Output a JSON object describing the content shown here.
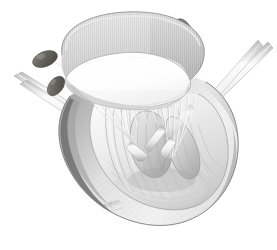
{
  "figure": {
    "medium": "graphite / pencil stipple medical illustration",
    "palette": {
      "background": "#ffffff",
      "paper": "#fdfdfd",
      "outline_dark": "#6f6f6f",
      "outline_mid": "#9a9a9a",
      "outline_light": "#c9c9c9",
      "myocardium_light": "#ededed",
      "myocardium_mid": "#d9d9d9",
      "myocardium_shadow": "#a8a8a8",
      "myocardium_deep_shadow": "#7d7d7d",
      "ring_fabric": "#dcdcdc",
      "ring_fabric_shade": "#bdbdbd",
      "orifice_white": "#fdfdfd",
      "pledget_dark": "#5d5a56",
      "pledget_mid": "#7b7771",
      "pledget_highlight": "#a5a19b",
      "instrument_steel": "#f2f2f2",
      "instrument_edge": "#9d9d9d",
      "chordae": "#f6f6f6",
      "signature_gray": "#8d8d8d"
    },
    "signature": "A. Miller",
    "annotations": {
      "annuloplasty_ring": "annuloplasty ring",
      "mitral_orifice": "mitral valve orifice",
      "pledgeted_sutures": "pledgeted mattress sutures",
      "chordae_tendineae": "chordae tendineae",
      "papillary_muscle": "papillary muscle",
      "ventricular_wall": "left ventricular wall",
      "trabeculae_carneae": "trabeculae carneae",
      "apex": "left ventricular apex",
      "retractor_left": "surgical retractor (left)",
      "retractor_right": "surgical retractor (right)",
      "nerve_hook": "nerve hook"
    },
    "counts": {
      "pledgets": 5,
      "instrument_shafts": 4,
      "papillary_muscles": 2
    }
  }
}
